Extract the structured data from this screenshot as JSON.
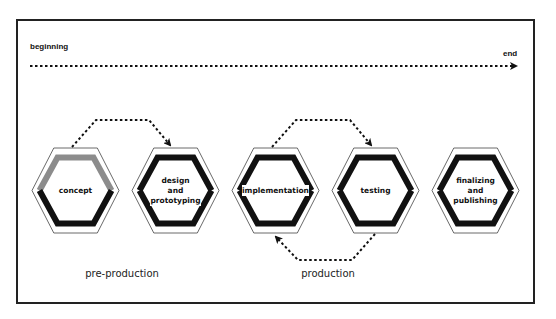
{
  "timeline": {
    "start_label": "beginning",
    "end_label": "end"
  },
  "stages": [
    {
      "id": "concept",
      "label": "concept",
      "cx": 75.5,
      "top_color": "#8c8c8c",
      "bottom_color": "#111111"
    },
    {
      "id": "design",
      "label": "design\nand\nprototyping",
      "lines": [
        "design",
        "and",
        "prototyping"
      ],
      "cx": 175.5,
      "top_color": "#111111",
      "bottom_color": "#111111"
    },
    {
      "id": "implementation",
      "label": "implementation",
      "cx": 275.5,
      "top_color": "#111111",
      "bottom_color": "#111111"
    },
    {
      "id": "testing",
      "label": "testing",
      "cx": 375.5,
      "top_color": "#111111",
      "bottom_color": "#111111"
    },
    {
      "id": "finalizing",
      "label": "finalizing\nand\npublishing",
      "lines": [
        "finalizing",
        "and",
        "publishing"
      ],
      "cx": 475.5,
      "top_color": "#111111",
      "bottom_color": "#111111"
    }
  ],
  "arrows": [
    {
      "from": "concept",
      "to": "design",
      "position": "top"
    },
    {
      "from": "implementation",
      "to": "testing",
      "position": "top"
    },
    {
      "from": "testing",
      "to": "implementation",
      "position": "bottom"
    }
  ],
  "phases": [
    {
      "label": "pre-production",
      "x": 122
    },
    {
      "label": "production",
      "x": 328
    }
  ],
  "colors": {
    "stroke": "#111111",
    "grey_accent": "#8c8c8c",
    "frame": "#222222"
  }
}
